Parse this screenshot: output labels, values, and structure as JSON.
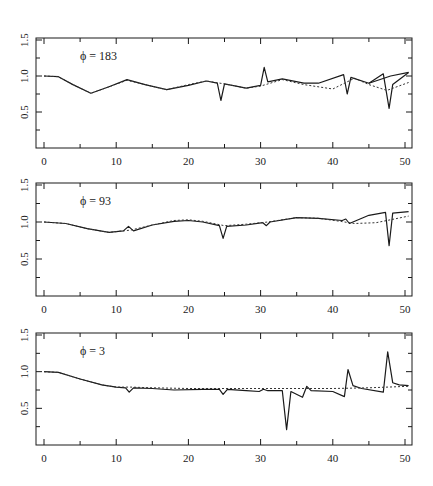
{
  "chart_data": [
    {
      "type": "line",
      "annotation": "ϕ = 183",
      "xlim": [
        0,
        51
      ],
      "ylim": [
        0,
        1.5
      ],
      "xticks": [
        0,
        10,
        20,
        30,
        40,
        50
      ],
      "xtick_labels": [
        "0",
        "10",
        "20",
        "30",
        "40",
        "50"
      ],
      "yticks": [
        0.5,
        1.0,
        1.5
      ],
      "ytick_labels": [
        "0.5",
        "1.0",
        "1.5"
      ],
      "series": [
        {
          "name": "solid",
          "style": "solid",
          "x": [
            0,
            2,
            4,
            6.5,
            9,
            11.5,
            14,
            17,
            20,
            22.5,
            24,
            24.5,
            25,
            28,
            30,
            30.5,
            31,
            33,
            36,
            38,
            41.5,
            42,
            42.5,
            45,
            47,
            47.8,
            48.3,
            50.5
          ],
          "y": [
            1.0,
            0.99,
            0.88,
            0.76,
            0.85,
            0.95,
            0.88,
            0.81,
            0.87,
            0.93,
            0.9,
            0.66,
            0.89,
            0.83,
            0.87,
            1.12,
            0.92,
            0.96,
            0.9,
            0.9,
            1.02,
            0.75,
            0.98,
            0.9,
            1.03,
            0.55,
            0.88,
            1.05
          ]
        },
        {
          "name": "solid-branch",
          "style": "solid",
          "x": [
            45,
            48,
            50.5
          ],
          "y": [
            0.9,
            1.0,
            1.05
          ]
        },
        {
          "name": "dotted",
          "style": "dotted",
          "x": [
            0,
            2,
            4,
            6.5,
            9,
            11.5,
            14,
            17,
            20,
            22.5,
            25,
            28,
            30,
            33,
            36,
            40,
            43,
            45,
            47.5,
            50.5
          ],
          "y": [
            1.0,
            0.99,
            0.88,
            0.76,
            0.85,
            0.94,
            0.88,
            0.81,
            0.88,
            0.93,
            0.89,
            0.83,
            0.86,
            0.95,
            0.88,
            0.82,
            0.97,
            0.88,
            0.8,
            0.91
          ]
        }
      ]
    },
    {
      "type": "line",
      "annotation": "ϕ = 93",
      "xlim": [
        0,
        51
      ],
      "ylim": [
        0,
        1.5
      ],
      "xticks": [
        0,
        10,
        20,
        30,
        40,
        50
      ],
      "xtick_labels": [
        "0",
        "10",
        "20",
        "30",
        "40",
        "50"
      ],
      "yticks": [
        0.5,
        1.0,
        1.5
      ],
      "ytick_labels": [
        "0.5",
        "1.0",
        "1.5"
      ],
      "series": [
        {
          "name": "solid",
          "style": "solid",
          "x": [
            0,
            3,
            6,
            9,
            11,
            11.7,
            12.4,
            15,
            18,
            20,
            22,
            24.3,
            24.8,
            25.3,
            28,
            30.3,
            30.8,
            31.3,
            35,
            38,
            41.3,
            41.8,
            42.3,
            45,
            47.3,
            47.8,
            48.3,
            50.5
          ],
          "y": [
            1.0,
            0.98,
            0.91,
            0.86,
            0.88,
            0.94,
            0.88,
            0.96,
            1.01,
            1.02,
            1.0,
            0.95,
            0.78,
            0.94,
            0.96,
            0.99,
            0.95,
            1.0,
            1.06,
            1.05,
            1.02,
            1.04,
            0.98,
            1.09,
            1.13,
            0.68,
            1.12,
            1.14
          ]
        },
        {
          "name": "dotted",
          "style": "dotted",
          "x": [
            0,
            3,
            6,
            9,
            12,
            15,
            18,
            20,
            22,
            25,
            28,
            31,
            35,
            38,
            41,
            43,
            46,
            50.5
          ],
          "y": [
            1.0,
            0.98,
            0.91,
            0.86,
            0.89,
            0.96,
            1.02,
            1.03,
            1.01,
            0.95,
            0.97,
            1.0,
            1.06,
            1.05,
            1.01,
            0.98,
            0.99,
            1.08
          ]
        }
      ]
    },
    {
      "type": "line",
      "annotation": "ϕ = 3",
      "xlim": [
        0,
        51
      ],
      "ylim": [
        0,
        1.5
      ],
      "xticks": [
        0,
        10,
        20,
        30,
        40,
        50
      ],
      "xtick_labels": [
        "0",
        "10",
        "20",
        "30",
        "40",
        "50"
      ],
      "yticks": [
        0.5,
        1.0,
        1.5
      ],
      "ytick_labels": [
        "0.5",
        "1.0",
        "1.5"
      ],
      "series": [
        {
          "name": "solid",
          "style": "solid",
          "x": [
            0,
            2,
            5,
            8,
            10,
            11.3,
            11.8,
            12.4,
            15,
            18,
            22,
            24.3,
            24.8,
            25.4,
            28,
            29.8,
            30.4,
            31,
            33,
            33.6,
            34.2,
            35.8,
            36.4,
            37,
            40,
            41.6,
            42.1,
            42.8,
            44,
            47,
            47.6,
            48.3,
            49.2,
            50.5
          ],
          "y": [
            1.0,
            0.99,
            0.9,
            0.82,
            0.79,
            0.78,
            0.72,
            0.78,
            0.77,
            0.75,
            0.76,
            0.76,
            0.69,
            0.76,
            0.74,
            0.73,
            0.76,
            0.74,
            0.74,
            0.21,
            0.73,
            0.65,
            0.8,
            0.74,
            0.73,
            0.66,
            1.03,
            0.81,
            0.77,
            0.72,
            1.27,
            0.85,
            0.82,
            0.81
          ]
        },
        {
          "name": "dotted",
          "style": "dotted",
          "x": [
            0,
            2,
            5,
            8,
            10,
            12,
            15,
            20,
            25,
            30,
            35,
            40,
            45,
            50.5
          ],
          "y": [
            1.0,
            0.99,
            0.9,
            0.82,
            0.79,
            0.79,
            0.78,
            0.77,
            0.77,
            0.77,
            0.77,
            0.77,
            0.78,
            0.8
          ]
        }
      ]
    }
  ]
}
